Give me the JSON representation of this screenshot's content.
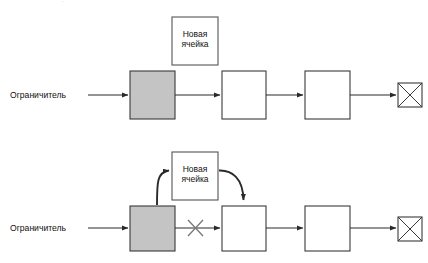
{
  "figure": {
    "type": "process-flow-diagram",
    "language": "ru",
    "background_color": "#ffffff",
    "stroke_color": "#2a2a2a",
    "constraint_fill_color": "#c4c4c4",
    "node_fill_color": "#ffffff",
    "clipped_caption_text": "."
  },
  "panels": [
    {
      "id": "before",
      "caption_label": "Ограничитель",
      "new_cell_label": "Новая\nячейка",
      "new_cell_attached": false,
      "nodes": [
        {
          "id": "constraint",
          "label": "",
          "kind": "constraint",
          "fill": "#c4c4c4"
        },
        {
          "id": "station-2",
          "label": "",
          "kind": "station",
          "fill": "#ffffff"
        },
        {
          "id": "station-3",
          "label": "",
          "kind": "station",
          "fill": "#ffffff"
        },
        {
          "id": "sink",
          "label": "",
          "kind": "crossed-sink",
          "fill": "#ffffff"
        }
      ],
      "flow_arrows": [
        {
          "from": "input",
          "to": "constraint",
          "style": "solid",
          "crossed_out": false
        },
        {
          "from": "constraint",
          "to": "station-2",
          "style": "solid",
          "crossed_out": false
        },
        {
          "from": "station-2",
          "to": "station-3",
          "style": "solid",
          "crossed_out": false
        },
        {
          "from": "station-3",
          "to": "sink",
          "style": "solid",
          "crossed_out": false
        }
      ]
    },
    {
      "id": "after",
      "caption_label": "Ограничитель",
      "new_cell_label": "Новая\nячейка",
      "new_cell_attached": true,
      "nodes": [
        {
          "id": "constraint",
          "label": "",
          "kind": "constraint",
          "fill": "#c4c4c4"
        },
        {
          "id": "station-2",
          "label": "",
          "kind": "station",
          "fill": "#ffffff"
        },
        {
          "id": "station-3",
          "label": "",
          "kind": "station",
          "fill": "#ffffff"
        },
        {
          "id": "sink",
          "label": "",
          "kind": "crossed-sink",
          "fill": "#ffffff"
        }
      ],
      "flow_arrows": [
        {
          "from": "input",
          "to": "constraint",
          "style": "solid",
          "crossed_out": false
        },
        {
          "from": "constraint",
          "to": "station-2",
          "style": "solid",
          "crossed_out": true
        },
        {
          "from": "station-2",
          "to": "station-3",
          "style": "solid",
          "crossed_out": false
        },
        {
          "from": "station-3",
          "to": "sink",
          "style": "solid",
          "crossed_out": false
        }
      ],
      "reroute_arrows": [
        {
          "from": "constraint",
          "to": "new-cell",
          "style": "curved",
          "direction": "up-right"
        },
        {
          "from": "new-cell",
          "to": "station-2",
          "style": "curved",
          "direction": "down-right"
        }
      ]
    }
  ]
}
